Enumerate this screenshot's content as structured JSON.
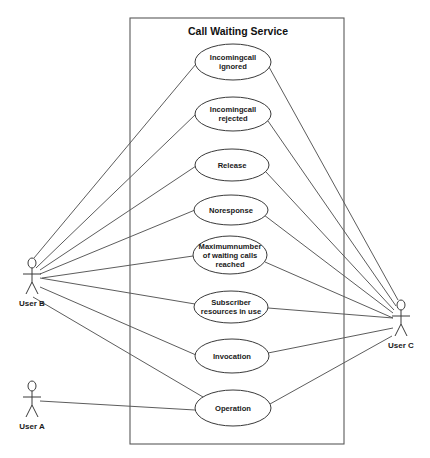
{
  "diagram": {
    "type": "uml-use-case",
    "system": {
      "title": "Call Waiting Service",
      "frame": {
        "x": 130,
        "y": 18,
        "w": 214,
        "h": 426
      }
    },
    "use_cases": [
      {
        "id": "uc1",
        "lines": [
          "Incomingcall",
          "ignored"
        ],
        "cx": 233,
        "cy": 62,
        "rx": 38,
        "ry": 18
      },
      {
        "id": "uc2",
        "lines": [
          "Incomingcall",
          "rejected"
        ],
        "cx": 233,
        "cy": 114,
        "rx": 38,
        "ry": 17
      },
      {
        "id": "uc3",
        "lines": [
          "Release"
        ],
        "cx": 232,
        "cy": 165,
        "rx": 37,
        "ry": 16
      },
      {
        "id": "uc4",
        "lines": [
          "Noresponse"
        ],
        "cx": 231,
        "cy": 210,
        "rx": 37,
        "ry": 15
      },
      {
        "id": "uc5",
        "lines": [
          "Maximumnumber",
          "of waiting calls",
          "reached"
        ],
        "cx": 230,
        "cy": 255,
        "rx": 37,
        "ry": 19
      },
      {
        "id": "uc6",
        "lines": [
          "Subscriber",
          "resources in use"
        ],
        "cx": 231,
        "cy": 307,
        "rx": 37,
        "ry": 16
      },
      {
        "id": "uc7",
        "lines": [
          "Invocation"
        ],
        "cx": 232,
        "cy": 356,
        "rx": 37,
        "ry": 17
      },
      {
        "id": "uc8",
        "lines": [
          "Operation"
        ],
        "cx": 233,
        "cy": 408,
        "rx": 38,
        "ry": 18
      }
    ],
    "actors": [
      {
        "id": "userB",
        "label": "User B",
        "x": 32,
        "head_y": 263
      },
      {
        "id": "userA",
        "label": "User A",
        "x": 32,
        "head_y": 386
      },
      {
        "id": "userC",
        "label": "User C",
        "x": 401,
        "head_y": 305
      }
    ],
    "associations": [
      {
        "from": "userB",
        "to": "uc1",
        "x1": 34,
        "y1": 258,
        "x2": 196,
        "y2": 64
      },
      {
        "from": "userB",
        "to": "uc2",
        "x1": 36,
        "y1": 268,
        "x2": 196,
        "y2": 114
      },
      {
        "from": "userB",
        "to": "uc3",
        "x1": 40,
        "y1": 270,
        "x2": 196,
        "y2": 166
      },
      {
        "from": "userB",
        "to": "uc4",
        "x1": 40,
        "y1": 274,
        "x2": 195,
        "y2": 210
      },
      {
        "from": "userB",
        "to": "uc5",
        "x1": 42,
        "y1": 278,
        "x2": 193,
        "y2": 256
      },
      {
        "from": "userB",
        "to": "uc6",
        "x1": 40,
        "y1": 278,
        "x2": 195,
        "y2": 304
      },
      {
        "from": "userB",
        "to": "uc7",
        "x1": 40,
        "y1": 287,
        "x2": 196,
        "y2": 355
      },
      {
        "from": "userB",
        "to": "uc8",
        "x1": 33,
        "y1": 297,
        "x2": 203,
        "y2": 397
      },
      {
        "from": "userA",
        "to": "uc8",
        "x1": 40,
        "y1": 401,
        "x2": 195,
        "y2": 410
      },
      {
        "from": "userC",
        "to": "uc1",
        "x1": 398,
        "y1": 300,
        "x2": 269,
        "y2": 67
      },
      {
        "from": "userC",
        "to": "uc2",
        "x1": 396,
        "y1": 306,
        "x2": 268,
        "y2": 121
      },
      {
        "from": "userC",
        "to": "uc3",
        "x1": 394,
        "y1": 310,
        "x2": 266,
        "y2": 172
      },
      {
        "from": "userC",
        "to": "uc4",
        "x1": 393,
        "y1": 313,
        "x2": 264,
        "y2": 215
      },
      {
        "from": "userC",
        "to": "uc5",
        "x1": 393,
        "y1": 318,
        "x2": 265,
        "y2": 262
      },
      {
        "from": "userC",
        "to": "uc6",
        "x1": 393,
        "y1": 318,
        "x2": 268,
        "y2": 308
      },
      {
        "from": "userC",
        "to": "uc7",
        "x1": 393,
        "y1": 328,
        "x2": 268,
        "y2": 353
      },
      {
        "from": "userC",
        "to": "uc8",
        "x1": 392,
        "y1": 336,
        "x2": 270,
        "y2": 404
      }
    ]
  }
}
